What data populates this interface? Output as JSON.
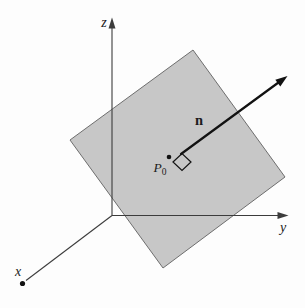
{
  "figure": {
    "type": "geometry-diagram"
  },
  "labels": {
    "z_axis": "z",
    "y_axis": "y",
    "x_axis": "x",
    "normal_vector": "n",
    "point_base": "P",
    "point_sub": "0"
  },
  "colors": {
    "background": "#fdfdfd",
    "plane_fill": "#c7c7c7",
    "plane_edge": "#6e6e6e",
    "axis_line": "#3c3c3c",
    "vector_line": "#121212",
    "text": "#1c1c1c"
  },
  "diagram": {
    "canvas": {
      "width": 305,
      "height": 308
    },
    "plane": {
      "points": "193,50 285,177 163,268 70,140"
    },
    "z_axis": {
      "x1": 112,
      "y1": 215.5,
      "x2": 112,
      "y2": 26,
      "arrow_points": "112,17.5 108.5,28.5 115.5,28.5"
    },
    "y_axis": {
      "x1": 112,
      "y1": 215.5,
      "x2": 280,
      "y2": 215.5,
      "arrow_points": "288.5,215.5 277.5,212 277.5,219"
    },
    "x_axis": {
      "x1": 112,
      "y1": 215.5,
      "x2": 26,
      "y2": 280.5,
      "end_dot": {
        "cx": 22.5,
        "cy": 283.5,
        "r": 2.6
      }
    },
    "normal_vector": {
      "x1": 181,
      "y1": 154,
      "x2": 280.5,
      "y2": 81,
      "arrow_points": "287.5,76 280.3,86.5 275.3,79.7"
    },
    "right_angle_marker": {
      "points": "173,162 182,153.5 191,162 182,170.5"
    },
    "p0_dot": {
      "cx": 169,
      "cy": 157,
      "r": 2.3
    },
    "label_positions": {
      "z": {
        "x": 104,
        "y": 27
      },
      "y": {
        "x": 283,
        "y": 232
      },
      "x": {
        "x": 18,
        "y": 276
      },
      "n": {
        "x": 199,
        "y": 125
      },
      "p0": {
        "x": 166.5,
        "y": 172
      }
    }
  }
}
